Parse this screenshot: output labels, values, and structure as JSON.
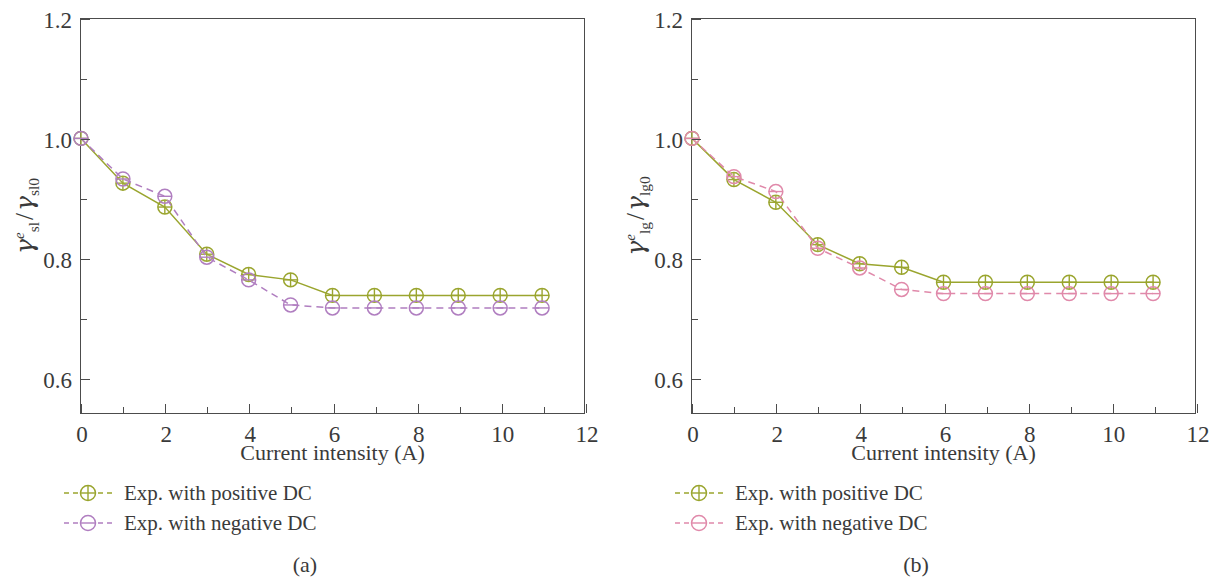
{
  "figure": {
    "panels": [
      {
        "caption": "(a)",
        "xlabel": "Current intensity (A)",
        "ylabel_parts": {
          "gamma": "γ",
          "sup": "e",
          "sub_num": "sl",
          "slash": "/",
          "sub_den": "sl0"
        },
        "legend": [
          {
            "label": "Exp. with positive DC",
            "color": "#9aa52e",
            "marker": "circle-plus"
          },
          {
            "label": "Exp. with negative DC",
            "color": "#b07ec0",
            "marker": "circle-minus"
          }
        ]
      },
      {
        "caption": "(b)",
        "xlabel": "Current intensity (A)",
        "ylabel_parts": {
          "gamma": "γ",
          "sup": "e",
          "sub_num": "lg",
          "slash": "/",
          "sub_den": "lg0"
        },
        "legend": [
          {
            "label": "Exp. with positive DC",
            "color": "#9aa52e",
            "marker": "circle-plus"
          },
          {
            "label": "Exp. with negative DC",
            "color": "#e089aa",
            "marker": "circle-minus"
          }
        ]
      }
    ]
  },
  "chart_data": [
    {
      "type": "line",
      "title": "(a)",
      "xlabel": "Current intensity (A)",
      "ylabel": "γ_sl^e / γ_sl0",
      "xlim": [
        0,
        12
      ],
      "ylim": [
        0.54,
        1.2
      ],
      "xticks": [
        0,
        2,
        4,
        6,
        8,
        10,
        12
      ],
      "xticks_minor": [
        1,
        3,
        5,
        7,
        9,
        11
      ],
      "yticks": [
        0.6,
        0.8,
        1.0,
        1.2
      ],
      "yticks_minor": [
        0.7,
        0.9,
        1.1
      ],
      "grid": false,
      "legend_position": "below-left",
      "x": [
        0,
        1,
        2,
        3,
        4,
        5,
        6,
        7,
        8,
        9,
        10,
        11
      ],
      "series": [
        {
          "name": "Exp. with positive DC",
          "color": "#9aa52e",
          "linestyle": "solid",
          "marker": "circle-plus",
          "values": [
            1.0,
            0.925,
            0.885,
            0.806,
            0.772,
            0.763,
            0.737,
            0.737,
            0.737,
            0.737,
            0.737,
            0.737
          ]
        },
        {
          "name": "Exp. with negative DC",
          "color": "#b07ec0",
          "linestyle": "dashed",
          "marker": "circle-minus",
          "values": [
            1.0,
            0.932,
            0.903,
            0.801,
            0.763,
            0.721,
            0.716,
            0.716,
            0.716,
            0.716,
            0.716,
            0.716
          ]
        }
      ]
    },
    {
      "type": "line",
      "title": "(b)",
      "xlabel": "Current intensity (A)",
      "ylabel": "γ_lg^e / γ_lg0",
      "xlim": [
        0,
        12
      ],
      "ylim": [
        0.54,
        1.2
      ],
      "xticks": [
        0,
        2,
        4,
        6,
        8,
        10,
        12
      ],
      "xticks_minor": [
        1,
        3,
        5,
        7,
        9,
        11
      ],
      "yticks": [
        0.6,
        0.8,
        1.0,
        1.2
      ],
      "yticks_minor": [
        0.7,
        0.9,
        1.1
      ],
      "grid": false,
      "legend_position": "below-left",
      "x": [
        0,
        1,
        2,
        3,
        4,
        5,
        6,
        7,
        8,
        9,
        10,
        11
      ],
      "series": [
        {
          "name": "Exp. with positive DC",
          "color": "#9aa52e",
          "linestyle": "solid",
          "marker": "circle-plus",
          "values": [
            1.0,
            0.931,
            0.893,
            0.822,
            0.79,
            0.784,
            0.759,
            0.759,
            0.759,
            0.759,
            0.759,
            0.759
          ]
        },
        {
          "name": "Exp. with negative DC",
          "color": "#e089aa",
          "linestyle": "dashed",
          "marker": "circle-minus",
          "values": [
            1.0,
            0.936,
            0.911,
            0.816,
            0.783,
            0.747,
            0.74,
            0.74,
            0.74,
            0.74,
            0.74,
            0.74
          ]
        }
      ]
    }
  ]
}
